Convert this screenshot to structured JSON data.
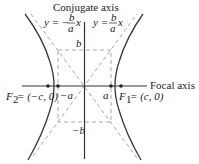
{
  "diagram": {
    "colors": {
      "curve": "#3a3a3a",
      "axis": "#333333",
      "dashed": "#a8a8a8",
      "text": "#222222",
      "background": "#ffffff"
    },
    "labels": {
      "conjugate_axis": "Conjugate axis",
      "focal_axis": "Focal axis",
      "asymptote_neg_prefix": "y = −",
      "asymptote_pos_prefix": "y = ",
      "frac_num": "b",
      "frac_den": "a",
      "x_var": "x",
      "b_label": "b",
      "neg_b_label": "−b",
      "a_label": "a",
      "neg_a_label": "−a",
      "f2_label": "F",
      "f2_sub": "2",
      "f2_coords": " = (−c, 0)",
      "f1_label": "F",
      "f1_sub": "1",
      "f1_coords": " = (c, 0)"
    },
    "geometry": {
      "center": [
        84.5,
        86
      ],
      "a": 26.5,
      "b": 36,
      "c": 37
    }
  }
}
